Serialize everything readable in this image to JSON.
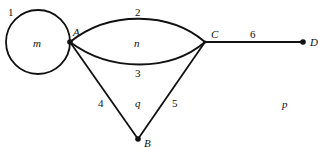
{
  "diagram": {
    "type": "planar-graph",
    "vertices": [
      {
        "id": "A",
        "label": "A"
      },
      {
        "id": "B",
        "label": "B"
      },
      {
        "id": "C",
        "label": "C"
      },
      {
        "id": "D",
        "label": "D"
      }
    ],
    "edges": [
      {
        "id": "1",
        "label": "1",
        "from": "A",
        "to": "A",
        "kind": "loop"
      },
      {
        "id": "2",
        "label": "2",
        "from": "A",
        "to": "C",
        "kind": "upper-arc"
      },
      {
        "id": "3",
        "label": "3",
        "from": "A",
        "to": "C",
        "kind": "lower-arc"
      },
      {
        "id": "4",
        "label": "4",
        "from": "A",
        "to": "B"
      },
      {
        "id": "5",
        "label": "5",
        "from": "C",
        "to": "B"
      },
      {
        "id": "6",
        "label": "6",
        "from": "C",
        "to": "D"
      }
    ],
    "faces": [
      {
        "id": "m",
        "label": "m"
      },
      {
        "id": "n",
        "label": "n"
      },
      {
        "id": "q",
        "label": "q"
      },
      {
        "id": "p",
        "label": "p"
      }
    ],
    "colors": {
      "stroke": "#111111",
      "background": "#ffffff"
    }
  }
}
